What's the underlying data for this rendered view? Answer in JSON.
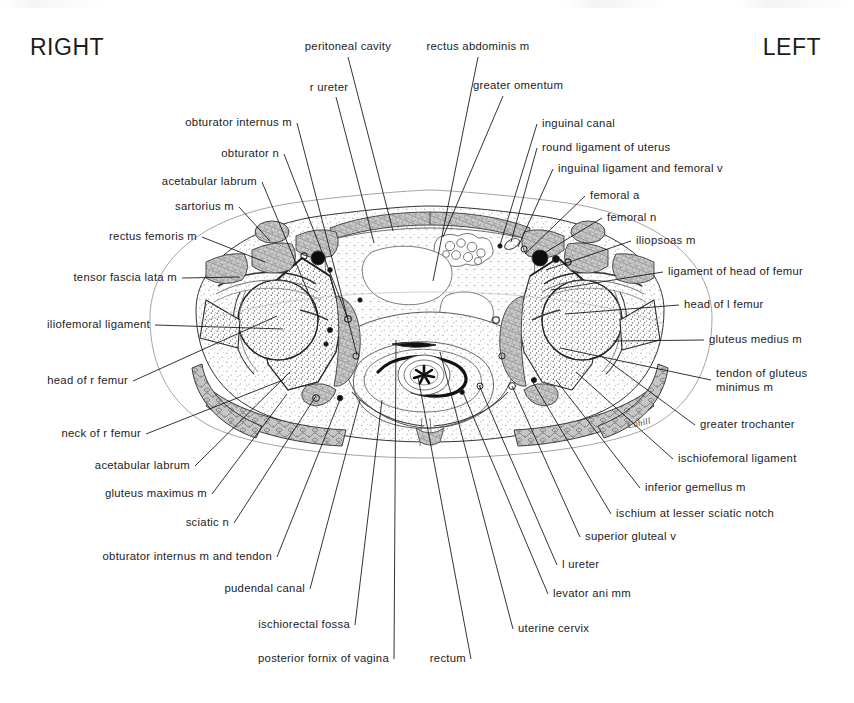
{
  "figure": {
    "type": "anatomical-cross-section",
    "region": "female pelvis, transverse section through hip joints",
    "artist_signature": "Cahill",
    "orientation": {
      "left_title": "RIGHT",
      "right_title": "LEFT"
    }
  },
  "labels": {
    "top": [
      {
        "id": "peritoneal-cavity",
        "text": "peritoneal cavity",
        "align": "c",
        "x": 348,
        "y": 47,
        "lx": 348,
        "ly": 57,
        "tx": 393,
        "ty": 231
      },
      {
        "id": "rectus-abdominis-m",
        "text": "rectus abdominis m",
        "align": "c",
        "x": 478,
        "y": 47,
        "lx": 478,
        "ly": 57,
        "tx": 433,
        "ty": 281
      },
      {
        "id": "greater-omentum",
        "text": "greater omentum",
        "align": "c",
        "x": 518,
        "y": 86,
        "lx": 503,
        "ly": 96,
        "tx": 443,
        "ty": 237
      },
      {
        "id": "r-ureter",
        "text": "r ureter",
        "align": "c",
        "x": 329,
        "y": 88,
        "lx": 336,
        "ly": 97,
        "tx": 374,
        "ty": 243
      }
    ],
    "left_column": [
      {
        "id": "obturator-internus-m",
        "text": "obturator internus m",
        "x": 292,
        "y": 123,
        "tx": 357,
        "ty": 355
      },
      {
        "id": "obturator-n",
        "text": "obturator n",
        "x": 279,
        "y": 154,
        "tx": 348,
        "ty": 319
      },
      {
        "id": "acetabular-labrum-sup",
        "text": "acetabular labrum",
        "x": 257,
        "y": 182,
        "tx": 319,
        "ty": 318
      },
      {
        "id": "sartorius-m",
        "text": "sartorius m",
        "x": 234,
        "y": 207,
        "tx": 270,
        "ty": 241
      },
      {
        "id": "rectus-femoris-m",
        "text": "rectus femoris m",
        "x": 197,
        "y": 237,
        "tx": 265,
        "ty": 262
      },
      {
        "id": "tensor-fascia-lata-m",
        "text": "tensor fascia lata m",
        "x": 177,
        "y": 278,
        "tx": 240,
        "ty": 277
      },
      {
        "id": "iliofemoral-ligament",
        "text": "iliofemoral ligament",
        "x": 150,
        "y": 325,
        "tx": 283,
        "ty": 329
      },
      {
        "id": "head-of-r-femur",
        "text": "head of r femur",
        "x": 128,
        "y": 381,
        "tx": 277,
        "ty": 316
      },
      {
        "id": "neck-of-r-femur",
        "text": "neck of r femur",
        "x": 141,
        "y": 434,
        "tx": 283,
        "ty": 380
      },
      {
        "id": "acetabular-labrum-inf",
        "text": "acetabular labrum",
        "x": 190,
        "y": 466,
        "tx": 290,
        "ty": 372
      },
      {
        "id": "gluteus-maximus-m",
        "text": "gluteus maximus m",
        "x": 207,
        "y": 494,
        "tx": 287,
        "ty": 394
      },
      {
        "id": "sciatic-n",
        "text": "sciatic n",
        "x": 229,
        "y": 523,
        "tx": 316,
        "ty": 396
      },
      {
        "id": "obturator-internus-m-and-tendon",
        "text": "obturator internus m and tendon",
        "x": 272,
        "y": 557,
        "tx": 341,
        "ty": 397
      },
      {
        "id": "pudendal-canal",
        "text": "pudendal canal",
        "x": 305,
        "y": 589,
        "tx": 360,
        "ty": 400
      },
      {
        "id": "ischiorectal-fossa",
        "text": "ischiorectal fossa",
        "x": 350,
        "y": 625,
        "tx": 382,
        "ty": 400
      },
      {
        "id": "posterior-fornix-of-vagina",
        "text": "posterior fornix of vagina",
        "x": 389,
        "y": 659,
        "tx": 396,
        "ty": 340
      },
      {
        "id": "rectum",
        "text": "rectum",
        "x": 466,
        "y": 659,
        "tx": 418,
        "ty": 377
      }
    ],
    "right_column": [
      {
        "id": "inguinal-canal",
        "text": "inguinal canal",
        "x": 542,
        "y": 124,
        "tx": 500,
        "ty": 245
      },
      {
        "id": "round-ligament-of-uterus",
        "text": "round ligament of uterus",
        "x": 542,
        "y": 148,
        "tx": 511,
        "ty": 242
      },
      {
        "id": "inguinal-ligament-and-femoral-v",
        "text": "inguinal ligament and femoral v",
        "x": 558,
        "y": 169,
        "tx": 518,
        "ty": 247
      },
      {
        "id": "femoral-a",
        "text": "femoral a",
        "x": 590,
        "y": 196,
        "tx": 525,
        "ty": 254
      },
      {
        "id": "femoral-n",
        "text": "femoral n",
        "x": 607,
        "y": 218,
        "tx": 536,
        "ty": 258
      },
      {
        "id": "iliopsoas-m",
        "text": "iliopsoas m",
        "x": 636,
        "y": 241,
        "tx": 546,
        "ty": 270
      },
      {
        "id": "ligament-of-head-of-femur",
        "text": "ligament of head of femur",
        "x": 668,
        "y": 272,
        "tx": 551,
        "ty": 290
      },
      {
        "id": "head-of-l-femur",
        "text": "head of l femur",
        "x": 684,
        "y": 305,
        "tx": 565,
        "ty": 314
      },
      {
        "id": "gluteus-medius-m",
        "text": "gluteus medius m",
        "x": 709,
        "y": 340,
        "tx": 613,
        "ty": 341
      },
      {
        "id": "tendon-of-gluteus-minimus-m",
        "text": "tendon of gluteus\nminimus m",
        "x": 716,
        "y": 380,
        "tx": 560,
        "ty": 348
      },
      {
        "id": "greater-trochanter",
        "text": "greater trochanter",
        "x": 700,
        "y": 425,
        "tx": 600,
        "ty": 355
      },
      {
        "id": "ischiofemoral-ligament",
        "text": "ischiofemoral ligament",
        "x": 678,
        "y": 459,
        "tx": 576,
        "ty": 372
      },
      {
        "id": "inferior-gemellus-m",
        "text": "inferior gemellus m",
        "x": 645,
        "y": 488,
        "tx": 556,
        "ty": 380
      },
      {
        "id": "ischium-at-lesser-sciatic-notch",
        "text": "ischium at lesser sciatic notch",
        "x": 616,
        "y": 514,
        "tx": 531,
        "ty": 379
      },
      {
        "id": "superior-gluteal-v",
        "text": "superior gluteal v",
        "x": 585,
        "y": 537,
        "tx": 512,
        "ty": 386
      },
      {
        "id": "l-ureter",
        "text": "l ureter",
        "x": 562,
        "y": 565,
        "tx": 479,
        "ty": 385
      },
      {
        "id": "levator-ani-mm",
        "text": "levator ani mm",
        "x": 553,
        "y": 594,
        "tx": 462,
        "ty": 390
      },
      {
        "id": "uterine-cervix",
        "text": "uterine cervix",
        "x": 518,
        "y": 629,
        "tx": 440,
        "ty": 352
      }
    ]
  },
  "colors": {
    "ink": "#111111",
    "text": "#1c1c1c",
    "muscle_fill": "#b9b9b9",
    "bone_fill": "#fbfbfb",
    "vessel_fill": "#0d0d0d",
    "fat_fill": "#fdfdfd",
    "outline": "#7a7a7a",
    "page_bg": "#ffffff"
  }
}
